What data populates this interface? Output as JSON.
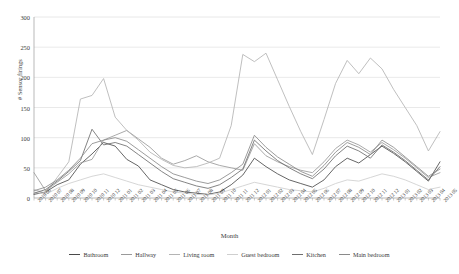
{
  "chart_data": {
    "type": "line",
    "title": "",
    "xlabel": "Month",
    "ylabel": "# Sensor firings",
    "ylim": [
      0,
      300
    ],
    "yticks": [
      0,
      50,
      100,
      150,
      200,
      250,
      300
    ],
    "grid": "horizontal",
    "legend_position": "bottom",
    "categories": [
      "2010 06",
      "2010 07",
      "2010 08",
      "2010 09",
      "2010 10",
      "2010 11",
      "2010 12",
      "2011 01",
      "2011 02",
      "2011 03",
      "2011 04",
      "2011 05",
      "2011 06",
      "2011 07",
      "2011 08",
      "2011 09",
      "2011 10",
      "2011 11",
      "2011 12",
      "2012 01",
      "2012 02",
      "2012 03",
      "2012 04",
      "2012 05",
      "2012 06",
      "2012 07",
      "2012 08",
      "2012 09",
      "2012 10",
      "2012 11",
      "2012 12",
      "2013 01",
      "2013 02",
      "2013 03",
      "2013 04",
      "2013 05"
    ],
    "series": [
      {
        "name": "Bathroom",
        "color": "#4a4a4a",
        "values": [
          6,
          10,
          22,
          30,
          56,
          73,
          92,
          86,
          64,
          53,
          30,
          22,
          14,
          10,
          8,
          6,
          10,
          22,
          38,
          66,
          52,
          40,
          30,
          24,
          18,
          30,
          52,
          66,
          58,
          72,
          86,
          74,
          60,
          44,
          28,
          60
        ]
      },
      {
        "name": "Hallway",
        "color": "#9a9a9a",
        "values": [
          42,
          12,
          26,
          40,
          58,
          64,
          96,
          104,
          112,
          98,
          84,
          66,
          56,
          62,
          70,
          60,
          54,
          50,
          46,
          90,
          70,
          60,
          52,
          46,
          42,
          60,
          82,
          96,
          88,
          76,
          92,
          80,
          66,
          50,
          34,
          42
        ]
      },
      {
        "name": "Living room",
        "color": "#b4b4b4",
        "values": [
          14,
          8,
          34,
          60,
          164,
          170,
          198,
          134,
          112,
          96,
          76,
          64,
          54,
          50,
          52,
          58,
          66,
          120,
          238,
          226,
          240,
          196,
          152,
          110,
          72,
          130,
          190,
          228,
          206,
          232,
          214,
          180,
          150,
          120,
          78,
          110
        ]
      },
      {
        "name": "Guest bedroom",
        "color": "#cfcfcf",
        "values": [
          10,
          6,
          16,
          24,
          30,
          36,
          40,
          34,
          28,
          22,
          18,
          14,
          10,
          8,
          6,
          5,
          8,
          14,
          20,
          26,
          22,
          18,
          14,
          12,
          10,
          16,
          24,
          30,
          28,
          34,
          40,
          36,
          30,
          22,
          14,
          18
        ]
      },
      {
        "name": "Kitchen",
        "color": "#6e6e6e",
        "values": [
          8,
          14,
          28,
          44,
          62,
          114,
          88,
          92,
          86,
          72,
          58,
          44,
          32,
          26,
          20,
          16,
          22,
          34,
          48,
          96,
          78,
          62,
          50,
          40,
          32,
          48,
          70,
          86,
          78,
          66,
          88,
          76,
          62,
          46,
          30,
          52
        ]
      },
      {
        "name": "Main bedroom",
        "color": "#8a8a8a",
        "values": [
          12,
          18,
          30,
          46,
          66,
          90,
          96,
          100,
          94,
          80,
          66,
          52,
          40,
          34,
          28,
          24,
          30,
          42,
          56,
          104,
          84,
          68,
          56,
          44,
          36,
          54,
          76,
          92,
          84,
          72,
          96,
          84,
          68,
          52,
          36,
          48
        ]
      }
    ]
  }
}
